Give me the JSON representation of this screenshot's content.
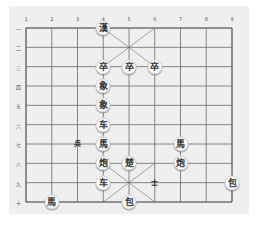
{
  "board": {
    "type": "xiangqi",
    "columns": 9,
    "rows": 10,
    "column_labels": [
      "1",
      "2",
      "3",
      "4",
      "5",
      "6",
      "7",
      "8",
      "9"
    ],
    "row_labels": [
      "一",
      "二",
      "三",
      "四",
      "五",
      "六",
      "七",
      "八",
      "九",
      "十"
    ],
    "line_color": "#6a6a6a",
    "background": "#efefef"
  },
  "pieces": [
    {
      "char": "漢",
      "col": 4,
      "row": 1,
      "name": "piece-han"
    },
    {
      "char": "卒",
      "col": 4,
      "row": 3,
      "name": "piece-soldier"
    },
    {
      "char": "卒",
      "col": 5,
      "row": 3,
      "name": "piece-soldier"
    },
    {
      "char": "卒",
      "col": 6,
      "row": 3,
      "name": "piece-soldier"
    },
    {
      "char": "象",
      "col": 4,
      "row": 4,
      "name": "piece-elephant"
    },
    {
      "char": "象",
      "col": 4,
      "row": 5,
      "name": "piece-elephant"
    },
    {
      "char": "车",
      "col": 4,
      "row": 6,
      "name": "piece-chariot"
    },
    {
      "char": "兵",
      "col": 3,
      "row": 7,
      "name": "piece-pawn",
      "small": true
    },
    {
      "char": "馬",
      "col": 4,
      "row": 7,
      "name": "piece-horse"
    },
    {
      "char": "馬",
      "col": 7,
      "row": 7,
      "name": "piece-horse"
    },
    {
      "char": "炮",
      "col": 4,
      "row": 8,
      "name": "piece-cannon"
    },
    {
      "char": "楚",
      "col": 5,
      "row": 8,
      "name": "piece-chu"
    },
    {
      "char": "炮",
      "col": 7,
      "row": 8,
      "name": "piece-cannon"
    },
    {
      "char": "车",
      "col": 4,
      "row": 9,
      "name": "piece-chariot"
    },
    {
      "char": "士",
      "col": 6,
      "row": 9,
      "name": "piece-advisor",
      "small": true
    },
    {
      "char": "包",
      "col": 9,
      "row": 9,
      "name": "piece-cannon"
    },
    {
      "char": "馬",
      "col": 2,
      "row": 10,
      "name": "piece-horse"
    },
    {
      "char": "包",
      "col": 5,
      "row": 10,
      "name": "piece-cannon"
    }
  ]
}
